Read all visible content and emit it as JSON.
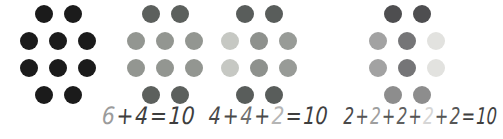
{
  "figure": {
    "background": "#ffffff",
    "groups": [
      {
        "name": "dot-group-all-black",
        "rows": [
          [
            "#1b1b1b",
            "#1b1b1b"
          ],
          [
            "#1b1b1b",
            "#1b1b1b",
            "#1b1b1b"
          ],
          [
            "#1b1b1b",
            "#1b1b1b",
            "#1b1b1b"
          ],
          [
            "#1b1b1b",
            "#1b1b1b"
          ]
        ]
      },
      {
        "name": "dot-group-six-plus-four",
        "rows": [
          [
            "#5c605d",
            "#5c605d"
          ],
          [
            "#939691",
            "#939691",
            "#939691"
          ],
          [
            "#939691",
            "#939691",
            "#939691"
          ],
          [
            "#5c605d",
            "#5c605d"
          ]
        ]
      },
      {
        "name": "dot-group-four-plus-four-plus-two",
        "rows": [
          [
            "#595d5b",
            "#595d5b"
          ],
          [
            "#c6c8c3",
            "#8e918d",
            "#989b97"
          ],
          [
            "#c6c8c3",
            "#8e918d",
            "#989b97"
          ],
          [
            "#595d5b",
            "#595d5b"
          ]
        ]
      },
      {
        "name": "dot-group-five-twos",
        "rows": [
          [
            "#4e4e50",
            "#4e4e50"
          ],
          [
            "#a2a2a2",
            "#757577",
            "#e2e2df"
          ],
          [
            "#a2a2a2",
            "#757577",
            "#e2e2df"
          ],
          [
            "#8d8d8d",
            "#8d8d8d"
          ]
        ]
      }
    ],
    "equations": [
      {
        "name": "equation-6-plus-4",
        "text": "6 + 4 = 10",
        "tokens": [
          {
            "text": "6",
            "color": "#9b9b9b"
          },
          {
            "text": "+",
            "color": "#3e3e3e"
          },
          {
            "text": "4",
            "color": "#3e3e3e"
          },
          {
            "text": "=",
            "color": "#3e3e3e"
          },
          {
            "text": "10",
            "color": "#3e3e3e"
          }
        ]
      },
      {
        "name": "equation-4-plus-4-plus-2",
        "text": "4 + 4 + 2 = 10",
        "tokens": [
          {
            "text": "4",
            "color": "#4a4a4a"
          },
          {
            "text": "+",
            "color": "#4a4a4a"
          },
          {
            "text": "4",
            "color": "#707070"
          },
          {
            "text": "+",
            "color": "#4a4a4a"
          },
          {
            "text": "2",
            "color": "#b5b5b5"
          },
          {
            "text": "=",
            "color": "#3e3e3e"
          },
          {
            "text": "10",
            "color": "#3e3e3e"
          }
        ]
      },
      {
        "name": "equation-2-plus-2-plus-2-plus-2-plus-2",
        "text": "2+2+2+2+2 = 10",
        "tokens": [
          {
            "text": "2",
            "color": "#4a4a4a"
          },
          {
            "text": "+",
            "color": "#555555"
          },
          {
            "text": "2",
            "color": "#9e9e9e"
          },
          {
            "text": "+",
            "color": "#555555"
          },
          {
            "text": "2",
            "color": "#5f5f5f"
          },
          {
            "text": "+",
            "color": "#555555"
          },
          {
            "text": "2",
            "color": "#d6d6d6"
          },
          {
            "text": "+",
            "color": "#555555"
          },
          {
            "text": "2",
            "color": "#565656"
          },
          {
            "text": "=",
            "color": "#3e3e3e"
          },
          {
            "text": "10",
            "color": "#3e3e3e"
          }
        ]
      }
    ]
  }
}
